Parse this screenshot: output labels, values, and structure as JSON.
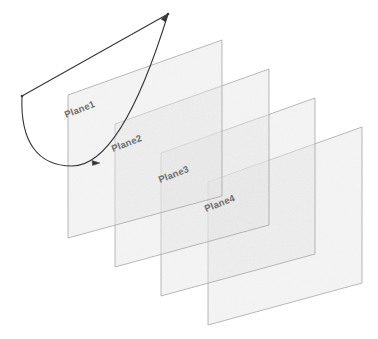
{
  "diagram": {
    "background_color": "#ffffff",
    "plane_fill_color": "#e6e6e6",
    "plane_stroke_color": "#9a9a9e",
    "label_color": "#6e6e70",
    "curve_color": "#35353a",
    "planes": [
      {
        "label": "Plane1",
        "label_x": 66,
        "label_y": 118,
        "label_rotation": -21,
        "points": "68,95 222,40 222,196 68,238",
        "fill_opacity": 0.45
      },
      {
        "label": "Plane2",
        "label_x": 113,
        "label_y": 152,
        "label_rotation": -21,
        "points": "115,124 269,69 269,225 115,267",
        "fill_opacity": 0.45
      },
      {
        "label": "Plane3",
        "label_x": 160,
        "label_y": 183,
        "label_rotation": -21,
        "points": "161,153 315,98 315,254 161,296",
        "fill_opacity": 0.45
      },
      {
        "label": "Plane4",
        "label_x": 206,
        "label_y": 212,
        "label_rotation": -21,
        "points": "208,182 362,127 362,283 208,325",
        "fill_opacity": 0.45
      }
    ],
    "curve": {
      "name": "parabolic-arc",
      "chord_start": [
        22,
        96
      ],
      "chord_end": [
        168,
        14
      ],
      "arc_path": "M 22 96 C 22 150 46 170 78 167 C 110 164 140 120 168 14",
      "arrow_tips": [
        {
          "name": "arrow-top-right",
          "x": 168,
          "y": 14,
          "rotation": -70
        },
        {
          "name": "arrow-bottom-mid",
          "x": 97,
          "y": 164,
          "rotation": 160
        }
      ],
      "vertices": [
        {
          "name": "vertex-left",
          "x": 22,
          "y": 96
        },
        {
          "name": "vertex-top",
          "x": 168,
          "y": 14
        }
      ]
    }
  }
}
